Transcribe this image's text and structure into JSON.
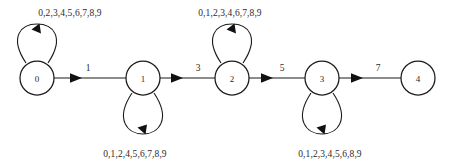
{
  "diagram": {
    "type": "finite-state-automaton",
    "background_color": "#ffffff",
    "stroke_color": "#1a1a1a",
    "text_color": "#2b2b2b",
    "states": [
      {
        "id": "q0",
        "label": "0",
        "cx": 37,
        "cy": 78,
        "r": 17
      },
      {
        "id": "q1",
        "label": "1",
        "cx": 143,
        "cy": 78,
        "r": 17
      },
      {
        "id": "q2",
        "label": "2",
        "cx": 232,
        "cy": 78,
        "r": 17
      },
      {
        "id": "q3",
        "label": "3",
        "cx": 322,
        "cy": 78,
        "r": 17
      },
      {
        "id": "q4",
        "label": "4",
        "cx": 418,
        "cy": 78,
        "r": 17
      }
    ],
    "transitions": [
      {
        "id": "t0",
        "from": "q0",
        "to": "q1",
        "label": "1",
        "label_x": 88,
        "label_y": 71
      },
      {
        "id": "t1",
        "from": "q1",
        "to": "q2",
        "label": "3",
        "label_x": 198,
        "label_y": 71
      },
      {
        "id": "t2",
        "from": "q2",
        "to": "q3",
        "label": "5",
        "label_x": 282,
        "label_y": 71
      },
      {
        "id": "t3",
        "from": "q3",
        "to": "q4",
        "label": "7",
        "label_x": 378,
        "label_y": 71
      }
    ],
    "self_loops": [
      {
        "id": "l0",
        "state": "q0",
        "direction": "up",
        "label": "0,2,3,4,5,6,7,8,9",
        "label_x": 70,
        "label_y": 16
      },
      {
        "id": "l1",
        "state": "q1",
        "direction": "down",
        "label": "0,1,2,4,5,6,7,8,9",
        "label_x": 135,
        "label_y": 157
      },
      {
        "id": "l2",
        "state": "q2",
        "direction": "up",
        "label": "0,1,2,3,4,6,7,8,9",
        "label_x": 230,
        "label_y": 16
      },
      {
        "id": "l3",
        "state": "q3",
        "direction": "down",
        "label": "0,1,2,3,4,5,6,8,9",
        "label_x": 330,
        "label_y": 157
      }
    ]
  }
}
